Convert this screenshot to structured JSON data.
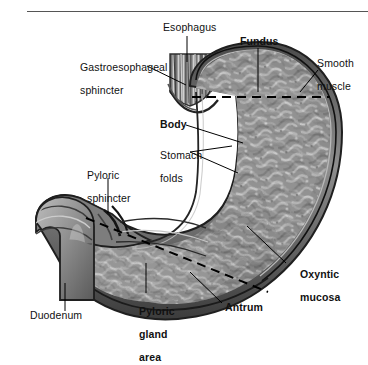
{
  "figure": {
    "style": "grayscale-medical-illustration",
    "header_rule": true,
    "colors": {
      "background": "#ffffff",
      "rule": "#555555",
      "outer_wall_dark": "#2e2e2e",
      "wall_mid": "#6b6b6b",
      "mucosa_mid": "#8a8a8a",
      "mucosa_light": "#c9c9c9",
      "leader_line": "#000000",
      "text": "#111111"
    }
  },
  "labels": [
    {
      "id": "esophagus",
      "text": "Esophagus",
      "bold": false,
      "x": 163,
      "y": 22,
      "lines": [
        "Esophagus"
      ]
    },
    {
      "id": "gastroesophageal-sphincter",
      "text": "Gastroesophageal sphincter",
      "bold": false,
      "x": 68,
      "y": 50,
      "lines": [
        "Gastroesophageal",
        "sphincter"
      ]
    },
    {
      "id": "fundus",
      "text": "Fundus",
      "bold": true,
      "x": 240,
      "y": 36,
      "lines": [
        "Fundus"
      ]
    },
    {
      "id": "smooth-muscle",
      "text": "Smooth muscle",
      "bold": false,
      "x": 305,
      "y": 46,
      "lines": [
        "Smooth",
        "muscle"
      ]
    },
    {
      "id": "body",
      "text": "Body",
      "bold": true,
      "x": 160,
      "y": 124,
      "lines": [
        "Body"
      ]
    },
    {
      "id": "stomach-folds",
      "text": "Stomach folds",
      "bold": false,
      "x": 148,
      "y": 142,
      "lines": [
        "Stomach",
        "folds"
      ]
    },
    {
      "id": "pyloric-sphincter",
      "text": "Pyloric sphincter",
      "bold": false,
      "x": 75,
      "y": 163,
      "lines": [
        "Pyloric",
        "sphincter"
      ]
    },
    {
      "id": "oxyntic-mucosa",
      "text": "Oxyntic mucosa",
      "bold": true,
      "x": 288,
      "y": 262,
      "lines": [
        "Oxyntic",
        "mucosa"
      ]
    },
    {
      "id": "antrum",
      "text": "Antrum",
      "bold": true,
      "x": 225,
      "y": 307,
      "lines": [
        "Antrum"
      ]
    },
    {
      "id": "pyloric-gland-area",
      "text": "Pyloric gland area",
      "bold": true,
      "x": 127,
      "y": 299,
      "lines": [
        "Pyloric",
        "gland",
        "area"
      ]
    },
    {
      "id": "duodenum",
      "text": "Duodenum",
      "bold": false,
      "x": 30,
      "y": 315,
      "lines": [
        "Duodenum"
      ]
    }
  ],
  "leaders": [
    {
      "id": "leader-esophagus",
      "points": "187,36 187,62"
    },
    {
      "id": "leader-gastroesophageal-sphincter",
      "points": "147,66 186,85"
    },
    {
      "id": "leader-fundus",
      "points": "258,48 258,92"
    },
    {
      "id": "leader-smooth-muscle",
      "points": "318,70 300,92"
    },
    {
      "id": "leader-body",
      "points": "186,125 243,143"
    },
    {
      "id": "leader-folds-a",
      "points": "190,152 232,146"
    },
    {
      "id": "leader-folds-b",
      "points": "190,152 238,173"
    },
    {
      "id": "leader-pyloric-sphincter",
      "points": "108,178 108,213"
    },
    {
      "id": "leader-oxyntic-mucosa",
      "points": "286,263 247,226"
    },
    {
      "id": "leader-antrum",
      "points": "222,303 190,272"
    },
    {
      "id": "leader-pyloric-gland-area",
      "points": "146,293 146,263"
    },
    {
      "id": "leader-duodenum",
      "points": "65,311 65,283"
    }
  ],
  "dashed_boundaries": [
    {
      "id": "fundus-body-boundary",
      "orientation": "horizontal",
      "points": "192,97 330,97"
    },
    {
      "id": "body-antrum-boundary",
      "orientation": "diagonal",
      "points": "86,218 268,292"
    }
  ]
}
